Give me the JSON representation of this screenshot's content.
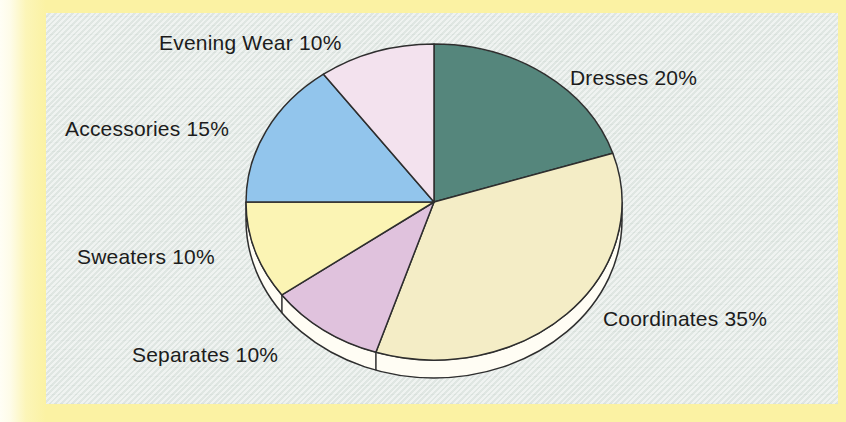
{
  "frame": {
    "outer_border_color": "#fbf2a3",
    "panel_background_color": "#e3eae6",
    "page_edge_color": "#fffef5"
  },
  "chart_data": {
    "type": "pie",
    "style": "3d-ellipse",
    "title": "",
    "start_angle_deg": 0,
    "direction": "clockwise",
    "legend": "none (labels placed around chart)",
    "outline_color": "#2e2e2e",
    "rim_color": "#fffdf4",
    "slices": [
      {
        "label": "Dresses",
        "value": 20,
        "display": "Dresses 20%",
        "color": "#55867c"
      },
      {
        "label": "Coordinates",
        "value": 35,
        "display": "Coordinates 35%",
        "color": "#f4edc6"
      },
      {
        "label": "Separates",
        "value": 10,
        "display": "Separates 10%",
        "color": "#e0c2dd"
      },
      {
        "label": "Sweaters",
        "value": 10,
        "display": "Sweaters 10%",
        "color": "#fbf4b4"
      },
      {
        "label": "Accessories",
        "value": 15,
        "display": "Accessories 15%",
        "color": "#92c5ec"
      },
      {
        "label": "Evening Wear",
        "value": 10,
        "display": "Evening Wear 10%",
        "color": "#f3e2ee"
      }
    ]
  }
}
